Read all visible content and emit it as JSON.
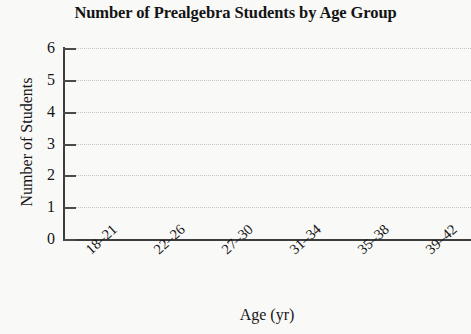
{
  "chart_data": {
    "type": "bar",
    "title": "Number of Prealgebra Students by Age Group",
    "xlabel": "Age (yr)",
    "ylabel": "Number of Students",
    "categories": [
      "18–21",
      "22–26",
      "27–30",
      "31–34",
      "35–38",
      "39–42"
    ],
    "values": [
      0,
      0,
      0,
      0,
      0,
      0
    ],
    "ylim": [
      0,
      6
    ],
    "yticks": [
      0,
      1,
      2,
      3,
      4,
      5,
      6
    ],
    "ytick_labels": [
      "0",
      "1",
      "2",
      "3",
      "4",
      "5",
      "6"
    ],
    "grid": "horizontal dotted gridlines at each integer y value",
    "legend": "none",
    "colors": {
      "background": "#f9f9f7",
      "axis": "#3c3c3c",
      "gridline": "#c4c6c4",
      "text": "#151515"
    }
  }
}
